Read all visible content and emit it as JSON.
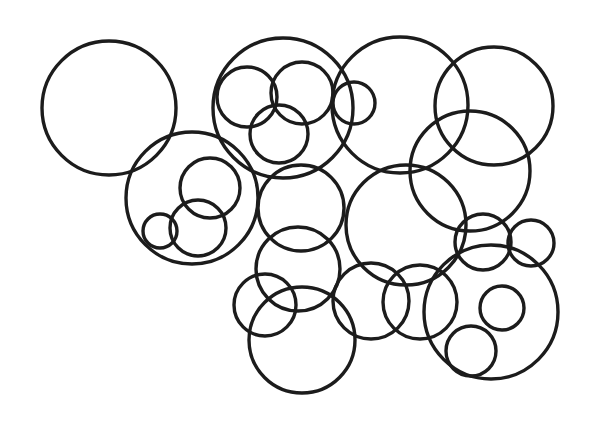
{
  "figure": {
    "stroke_color": "#1c1c1c",
    "background": "#ffffff",
    "circles": [
      {
        "cx": 109,
        "cy": 108,
        "r": 67
      },
      {
        "cx": 192,
        "cy": 198,
        "r": 66
      },
      {
        "cx": 210,
        "cy": 188,
        "r": 30
      },
      {
        "cx": 198,
        "cy": 228,
        "r": 28
      },
      {
        "cx": 160,
        "cy": 231,
        "r": 17
      },
      {
        "cx": 283,
        "cy": 108,
        "r": 70
      },
      {
        "cx": 247,
        "cy": 97,
        "r": 30
      },
      {
        "cx": 302,
        "cy": 93,
        "r": 31
      },
      {
        "cx": 279,
        "cy": 134,
        "r": 29
      },
      {
        "cx": 354,
        "cy": 103,
        "r": 21
      },
      {
        "cx": 400,
        "cy": 105,
        "r": 68
      },
      {
        "cx": 494,
        "cy": 106,
        "r": 59
      },
      {
        "cx": 470,
        "cy": 171,
        "r": 60
      },
      {
        "cx": 301,
        "cy": 208,
        "r": 43
      },
      {
        "cx": 406,
        "cy": 225,
        "r": 60
      },
      {
        "cx": 298,
        "cy": 269,
        "r": 42
      },
      {
        "cx": 265,
        "cy": 305,
        "r": 31
      },
      {
        "cx": 302,
        "cy": 340,
        "r": 53
      },
      {
        "cx": 371,
        "cy": 301,
        "r": 38
      },
      {
        "cx": 420,
        "cy": 302,
        "r": 37
      },
      {
        "cx": 483,
        "cy": 242,
        "r": 28
      },
      {
        "cx": 531,
        "cy": 243,
        "r": 23
      },
      {
        "cx": 491,
        "cy": 312,
        "r": 67
      },
      {
        "cx": 502,
        "cy": 308,
        "r": 22
      },
      {
        "cx": 471,
        "cy": 351,
        "r": 25
      }
    ]
  }
}
